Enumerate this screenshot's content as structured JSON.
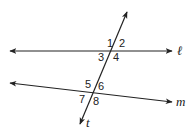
{
  "diagram": {
    "type": "parallel-lines-transversal",
    "stroke_color": "#222222",
    "lines": {
      "l": {
        "label": "ℓ",
        "x1": 10,
        "y1": 51,
        "x2": 172,
        "y2": 51
      },
      "m": {
        "label": "m",
        "x1": 10,
        "y1": 83,
        "x2": 172,
        "y2": 102
      },
      "t": {
        "label": "t",
        "x1": 127,
        "y1": 12,
        "x2": 80,
        "y2": 124
      }
    },
    "angles": [
      {
        "label": "1",
        "x": 107,
        "y": 47
      },
      {
        "label": "2",
        "x": 119,
        "y": 47
      },
      {
        "label": "3",
        "x": 98,
        "y": 60
      },
      {
        "label": "4",
        "x": 113,
        "y": 61
      },
      {
        "label": "5",
        "x": 85,
        "y": 88
      },
      {
        "label": "6",
        "x": 98,
        "y": 90
      },
      {
        "label": "7",
        "x": 79,
        "y": 102
      },
      {
        "label": "8",
        "x": 93,
        "y": 105
      }
    ]
  }
}
